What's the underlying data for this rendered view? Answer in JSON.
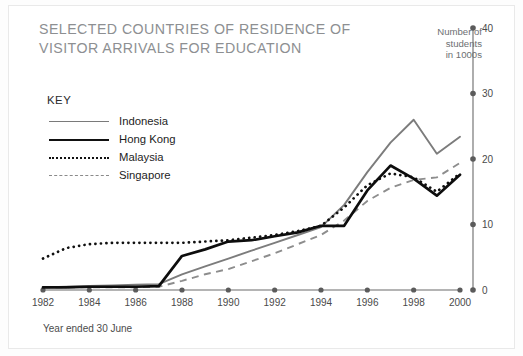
{
  "figure": {
    "title": "SELECTED COUNTRIES OF RESIDENCE OF\nVISITOR ARRIVALS FOR EDUCATION",
    "axis_unit_caption": "Number of\nstudents\nin 1000s",
    "x_axis_caption": "Year ended 30 June",
    "legend_title": "KEY"
  },
  "colors": {
    "title": "#8d8f92",
    "indonesia": "#7c7c7c",
    "hong_kong": "#0d0d0d",
    "malaysia": "#101010",
    "singapore": "#8d8d8d",
    "axis": "#6b6b6b",
    "card_background": "#ffffff",
    "page_background": "#fdfdfd"
  },
  "legend": {
    "items": [
      {
        "label": "Indonesia",
        "style": "solid-gray"
      },
      {
        "label": "Hong Kong",
        "style": "solid-black"
      },
      {
        "label": "Malaysia",
        "style": "dotted"
      },
      {
        "label": "Singapore",
        "style": "dashed"
      }
    ]
  },
  "chart_data": {
    "type": "line",
    "title": "SELECTED COUNTRIES OF RESIDENCE OF VISITOR ARRIVALS FOR EDUCATION",
    "xlabel": "Year ended 30 June",
    "ylabel": "Number of students in 1000s",
    "xlim": [
      1982,
      2000
    ],
    "ylim": [
      0,
      40
    ],
    "x_ticks": [
      1982,
      1984,
      1986,
      1988,
      1990,
      1992,
      1994,
      1996,
      1998,
      2000
    ],
    "x_tick_labels": [
      "1982",
      "1984",
      "1986",
      "1988",
      "1990",
      "1992",
      "1994",
      "1996",
      "1998",
      "2000"
    ],
    "y_ticks": [
      0,
      10,
      20,
      30,
      40
    ],
    "y_tick_labels": [
      "0",
      "10",
      "20",
      "30",
      "40"
    ],
    "y_axis_position": "right",
    "grid": false,
    "legend_position": "upper-left",
    "x": [
      1982,
      1983,
      1984,
      1985,
      1986,
      1987,
      1988,
      1989,
      1990,
      1991,
      1992,
      1993,
      1994,
      1995,
      1996,
      1997,
      1998,
      1999,
      2000
    ],
    "series": [
      {
        "name": "Indonesia",
        "values": [
          0.4,
          0.5,
          0.6,
          0.7,
          0.8,
          0.9,
          2.4,
          3.6,
          4.8,
          6.0,
          7.2,
          8.4,
          9.6,
          13.0,
          18.0,
          22.5,
          26.0,
          20.8,
          23.4
        ]
      },
      {
        "name": "Hong Kong",
        "values": [
          0.4,
          0.4,
          0.5,
          0.5,
          0.5,
          0.6,
          5.2,
          6.2,
          7.4,
          7.6,
          8.2,
          8.8,
          9.8,
          9.8,
          15.2,
          19.0,
          17.0,
          14.4,
          17.6
        ]
      },
      {
        "name": "Malaysia",
        "values": [
          4.8,
          6.4,
          7.0,
          7.2,
          7.2,
          7.2,
          7.2,
          7.4,
          7.6,
          8.0,
          8.4,
          9.0,
          9.8,
          12.6,
          16.0,
          17.8,
          17.2,
          15.0,
          17.8
        ]
      },
      {
        "name": "Singapore",
        "values": [
          0.4,
          0.4,
          0.4,
          0.4,
          0.4,
          0.5,
          1.4,
          2.4,
          3.2,
          4.4,
          5.6,
          7.0,
          8.4,
          10.6,
          13.6,
          15.6,
          16.8,
          17.2,
          19.4
        ]
      }
    ]
  }
}
